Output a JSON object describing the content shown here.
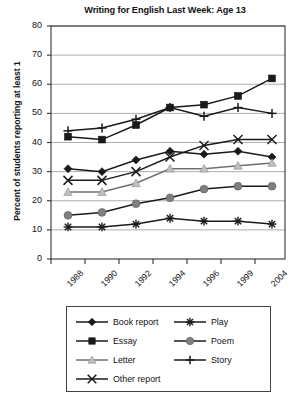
{
  "chart_data": {
    "type": "line",
    "title": "Writing for English Last Week: Age 13",
    "xlabel": "",
    "ylabel": "Percent of students reporting at least 1",
    "categories": [
      "1988",
      "1990",
      "1992",
      "1994",
      "1996",
      "1999",
      "2004"
    ],
    "x_tick_labels": [
      "1988",
      "1990",
      "1992",
      "1994",
      "1996",
      "1999",
      "2004"
    ],
    "y_tick_labels": [
      "0",
      "10",
      "20",
      "30",
      "40",
      "50",
      "60",
      "70",
      "80"
    ],
    "ylim": [
      0,
      80
    ],
    "ytick_step": 10,
    "grid": "horizontal",
    "legend_position": "below-plot",
    "series": [
      {
        "name": "Book report",
        "marker": "filled-diamond",
        "color": "#1a1a1a",
        "values": [
          31,
          30,
          34,
          37,
          36,
          37,
          35
        ]
      },
      {
        "name": "Essay",
        "marker": "filled-square",
        "color": "#1a1a1a",
        "values": [
          42,
          41,
          46,
          52,
          53,
          56,
          62
        ]
      },
      {
        "name": "Letter",
        "marker": "light-triangle",
        "color": "#c0c0c0",
        "values": [
          23,
          23,
          26,
          31,
          31,
          32,
          33
        ]
      },
      {
        "name": "Other report",
        "marker": "cross-x",
        "color": "#1a1a1a",
        "values": [
          27,
          27,
          30,
          35,
          39,
          41,
          41
        ]
      },
      {
        "name": "Play",
        "marker": "asterisk",
        "color": "#1a1a1a",
        "values": [
          11,
          11,
          12,
          14,
          13,
          13,
          12
        ]
      },
      {
        "name": "Poem",
        "marker": "gray-circle",
        "color": "#808080",
        "values": [
          15,
          16,
          19,
          21,
          24,
          25,
          25
        ]
      },
      {
        "name": "Story",
        "marker": "plus",
        "color": "#1a1a1a",
        "values": [
          44,
          45,
          48,
          52,
          49,
          52,
          50
        ]
      }
    ]
  },
  "legend": {
    "column1": [
      "Book report",
      "Essay",
      "Letter",
      "Other report"
    ],
    "column2": [
      "Play",
      "Poem",
      "Story"
    ]
  }
}
